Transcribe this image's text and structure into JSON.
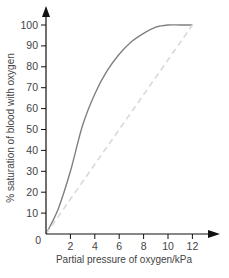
{
  "chart_data": {
    "type": "line",
    "title": "",
    "xlabel": "Partial pressure of oxygen/kPa",
    "ylabel": "% saturation of blood with oxygen",
    "xlim": [
      0,
      12
    ],
    "ylim": [
      0,
      100
    ],
    "x_ticks": [
      "2",
      "4",
      "6",
      "8",
      "10",
      "12"
    ],
    "y_ticks": [
      "10",
      "20",
      "30",
      "40",
      "50",
      "60",
      "70",
      "80",
      "90",
      "100"
    ],
    "origin_label": "0",
    "grid": false,
    "legend": null,
    "series": [
      {
        "name": "Oxygen dissociation curve",
        "style": "solid",
        "color": "#808080",
        "x": [
          0,
          1,
          2,
          3,
          4,
          5,
          6,
          7,
          8,
          9,
          10,
          11,
          12
        ],
        "y": [
          0,
          12,
          30,
          52,
          67,
          78,
          86,
          92,
          96,
          99,
          100,
          100,
          100
        ]
      },
      {
        "name": "Linear reference",
        "style": "dashed",
        "color": "#d9d9d9",
        "x": [
          0,
          12
        ],
        "y": [
          0,
          100
        ]
      }
    ]
  }
}
